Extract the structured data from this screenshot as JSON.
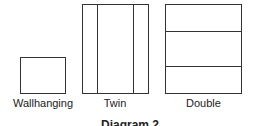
{
  "diagram": {
    "shapes": [
      {
        "name": "Wallhanging",
        "label": "Wallhanging"
      },
      {
        "name": "Twin",
        "label": "Twin"
      },
      {
        "name": "Double",
        "label": "Double"
      }
    ],
    "caption": "Diagram 2"
  }
}
